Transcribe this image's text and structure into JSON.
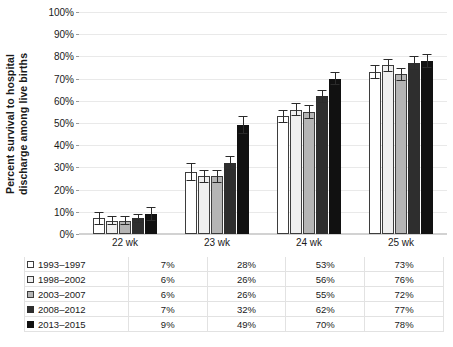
{
  "chart_data": {
    "type": "bar",
    "title": "",
    "subtitle": "",
    "xlabel": "",
    "ylabel": "Percent survival to hospital discharge among live births",
    "ylabel_lines": [
      "Percent survival to hospital",
      "discharge among live births"
    ],
    "categories": [
      "22 wk",
      "23 wk",
      "24 wk",
      "25 wk"
    ],
    "ylim": [
      0,
      100
    ],
    "ytick_labels": [
      "0%",
      "10%",
      "20%",
      "30%",
      "40%",
      "50%",
      "60%",
      "70%",
      "80%",
      "90%",
      "100%"
    ],
    "ytick_values": [
      0,
      10,
      20,
      30,
      40,
      50,
      60,
      70,
      80,
      90,
      100
    ],
    "grid": true,
    "legend_position": "table-below",
    "units": "%",
    "series": [
      {
        "name": "1993–1997",
        "color": "#ffffff",
        "border": "#3d3d3d",
        "values": [
          7,
          28,
          53,
          73
        ],
        "labels": [
          "7%",
          "28%",
          "53%",
          "73%"
        ],
        "err_low": [
          3,
          4,
          3,
          3
        ],
        "err_high": [
          3,
          4,
          3,
          3
        ]
      },
      {
        "name": "1998–2002",
        "color": "#efefef",
        "border": "#3d3d3d",
        "values": [
          6,
          26,
          56,
          76
        ],
        "labels": [
          "6%",
          "26%",
          "56%",
          "76%"
        ],
        "err_low": [
          2,
          3,
          3,
          3
        ],
        "err_high": [
          2,
          3,
          3,
          3
        ]
      },
      {
        "name": "2003–2007",
        "color": "#b5b5b5",
        "border": "#3d3d3d",
        "values": [
          6,
          26,
          55,
          72
        ],
        "labels": [
          "6%",
          "26%",
          "55%",
          "72%"
        ],
        "err_low": [
          2,
          3,
          3,
          3
        ],
        "err_high": [
          2,
          3,
          3,
          3
        ]
      },
      {
        "name": "2008–2012",
        "color": "#2e2e2e",
        "border": "#2e2e2e",
        "values": [
          7,
          32,
          62,
          77
        ],
        "labels": [
          "7%",
          "32%",
          "62%",
          "77%"
        ],
        "err_low": [
          2,
          3,
          3,
          3
        ],
        "err_high": [
          2,
          3,
          3,
          3
        ]
      },
      {
        "name": "2013–2015",
        "color": "#111111",
        "border": "#111111",
        "values": [
          9,
          49,
          70,
          78
        ],
        "labels": [
          "9%",
          "49%",
          "70%",
          "78%"
        ],
        "err_low": [
          3,
          4,
          3,
          3
        ],
        "err_high": [
          3,
          4,
          3,
          3
        ]
      }
    ]
  },
  "table": {
    "header": [
      "",
      "22 wk",
      "23 wk",
      "24 wk",
      "25 wk"
    ],
    "rows": [
      {
        "series": "1993–1997",
        "values": [
          "7%",
          "28%",
          "53%",
          "73%"
        ]
      },
      {
        "series": "1998–2002",
        "values": [
          "6%",
          "26%",
          "56%",
          "76%"
        ]
      },
      {
        "series": "2003–2007",
        "values": [
          "6%",
          "26%",
          "55%",
          "72%"
        ]
      },
      {
        "series": "2008–2012",
        "values": [
          "7%",
          "32%",
          "62%",
          "77%"
        ]
      },
      {
        "series": "2013–2015",
        "values": [
          "9%",
          "49%",
          "70%",
          "78%"
        ]
      }
    ]
  }
}
